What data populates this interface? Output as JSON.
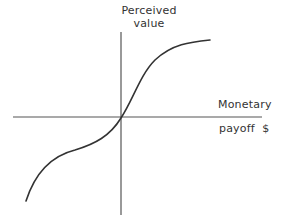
{
  "diagram": {
    "type": "s-curve value function",
    "y_axis_label": [
      "Perceived",
      "value"
    ],
    "x_axis_label": [
      "Monetary",
      "payoff  $"
    ],
    "colors": {
      "axis": "#555555",
      "curve": "#333333",
      "text": "#333333",
      "background": "#ffffff"
    },
    "curve_description": "S-shaped curve through origin: concave for gains (upper right), convex for losses (lower left)"
  }
}
